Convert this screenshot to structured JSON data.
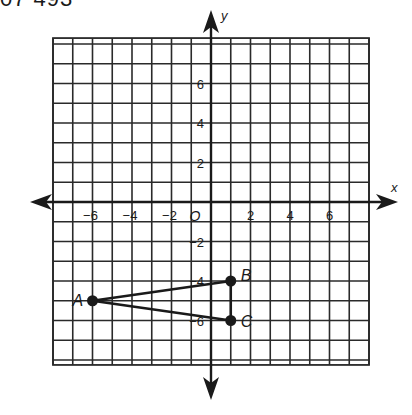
{
  "header": {
    "text": "07 493"
  },
  "figure": {
    "axes": {
      "x_label": "x",
      "y_label": "y",
      "origin_label": "O"
    },
    "grid": {
      "x_min": -8,
      "x_max": 8,
      "y_min": -8.25,
      "y_max": 8.3,
      "step": 1
    },
    "x_ticks": [
      {
        "value": -6,
        "label": "−6"
      },
      {
        "value": -4,
        "label": "−4"
      },
      {
        "value": -2,
        "label": "−2"
      },
      {
        "value": 2,
        "label": "2"
      },
      {
        "value": 4,
        "label": "4"
      },
      {
        "value": 6,
        "label": "6"
      }
    ],
    "y_ticks": [
      {
        "value": 6,
        "label": "6"
      },
      {
        "value": 4,
        "label": "4"
      },
      {
        "value": 2,
        "label": "2"
      },
      {
        "value": -2,
        "label": "−2"
      },
      {
        "value": -4,
        "label": "−4"
      },
      {
        "value": -6,
        "label": "−6"
      }
    ],
    "points": [
      {
        "name": "A",
        "x": -6,
        "y": -5
      },
      {
        "name": "B",
        "x": 1,
        "y": -4
      },
      {
        "name": "C",
        "x": 1,
        "y": -6
      }
    ],
    "segments": [
      [
        "A",
        "B"
      ],
      [
        "B",
        "C"
      ],
      [
        "C",
        "A"
      ]
    ],
    "colors": {
      "line": "#1a1a1a",
      "grid": "#2a2a2a",
      "background": "#ffffff"
    }
  }
}
